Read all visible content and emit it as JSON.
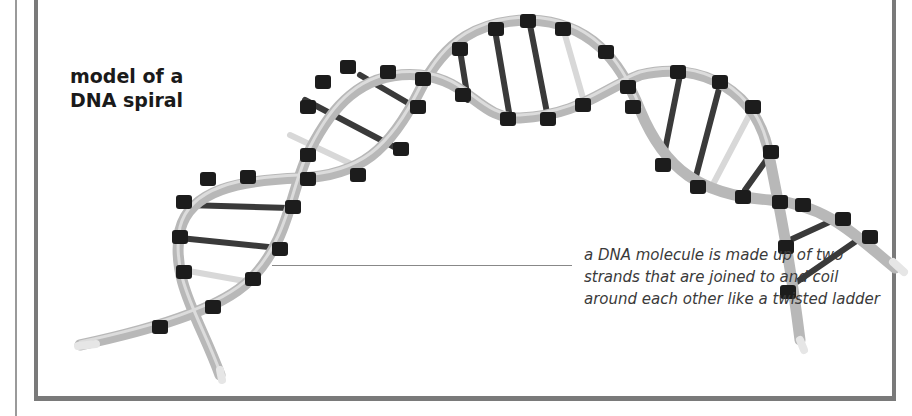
{
  "title": {
    "line1": "model of a",
    "line2": "DNA spiral"
  },
  "caption": {
    "line1": "a DNA molecule is made up of two",
    "line2": "strands that are joined to and coil",
    "line3": "around each other like a twisted ladder"
  },
  "image": {
    "subject": "dna-double-helix-model",
    "colors": {
      "strand": "#b8b8b8",
      "clip": "#1c1c1c",
      "rung_dark": "#3a3a3a",
      "rung_light": "#d8d8d8",
      "frame": "#7a7a7a"
    }
  }
}
